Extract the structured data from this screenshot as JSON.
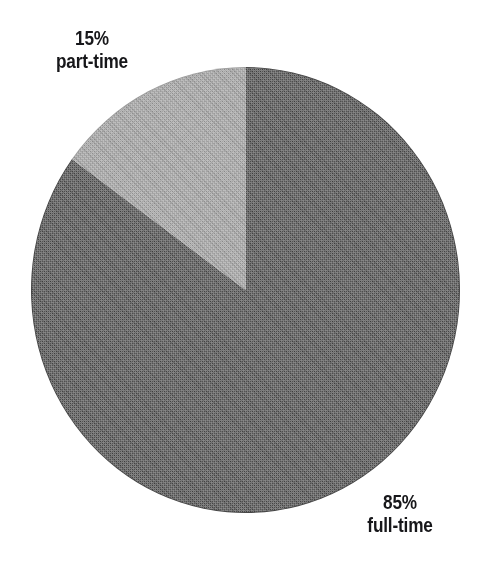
{
  "figure": {
    "background_color": "#ffffff",
    "width": 484,
    "height": 569
  },
  "chart_data": {
    "type": "pie",
    "title": "",
    "subtitle": "",
    "xlabel": "",
    "ylabel": "",
    "legend_position": "none",
    "grid": false,
    "start_angle_deg": 90,
    "direction": "clockwise",
    "categories": [
      "full-time",
      "part-time"
    ],
    "values": [
      85,
      15
    ],
    "units": "percent",
    "slices": [
      {
        "label": "full-time",
        "percent_label": "85%",
        "value": 85,
        "color": "#454545",
        "label_position": "bottom-right"
      },
      {
        "label": "part-time",
        "percent_label": "15%",
        "value": 15,
        "color": "#9b9b9b",
        "label_position": "top-left"
      }
    ],
    "annotations": [
      {
        "text": "15%",
        "target": "part-time"
      },
      {
        "text": "part-time",
        "target": "part-time"
      },
      {
        "text": "85%",
        "target": "full-time"
      },
      {
        "text": "full-time",
        "target": "full-time"
      }
    ]
  },
  "labels": {
    "part_time": {
      "percent": "15%",
      "name": "part-time"
    },
    "full_time": {
      "percent": "85%",
      "name": "full-time"
    }
  },
  "colors": {
    "slice_full_time": "#454545",
    "slice_part_time": "#9b9b9b",
    "text": "#17171a",
    "background": "#ffffff"
  }
}
